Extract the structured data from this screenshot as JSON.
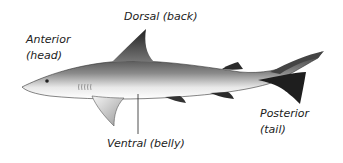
{
  "diagram": {
    "labels": {
      "dorsal": "Dorsal (back)",
      "anterior_line1": "Anterior",
      "anterior_line2": "(head)",
      "ventral": "Ventral (belly)",
      "posterior_line1": "Posterior",
      "posterior_line2": "(tail)"
    },
    "colors": {
      "body_dark": "#2a2a2a",
      "body_light": "#f2f2f2",
      "text": "#222222"
    }
  }
}
